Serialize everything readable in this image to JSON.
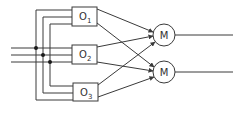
{
  "diagram": {
    "type": "network",
    "colors": {
      "line": "#3a3a3a",
      "background": "#ffffff",
      "text": "#333333"
    },
    "inputs": {
      "count": 3
    },
    "operators": [
      {
        "label": "O",
        "sub": "1"
      },
      {
        "label": "O",
        "sub": "2"
      },
      {
        "label": "O",
        "sub": "3"
      }
    ],
    "merges": [
      {
        "label": "M"
      },
      {
        "label": "M"
      }
    ],
    "outputs": {
      "count": 2
    }
  }
}
